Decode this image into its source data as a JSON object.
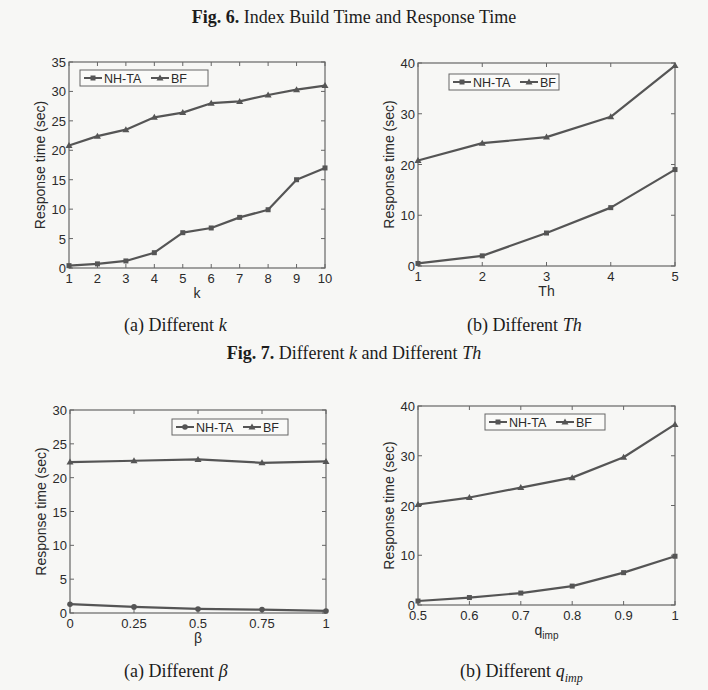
{
  "figures": {
    "fig6": {
      "label": "Fig. 6.",
      "title": "Index Build Time and Response Time"
    },
    "fig7": {
      "label": "Fig. 7.",
      "title_pre": "Different ",
      "title_k": "k",
      "title_mid": " and Different ",
      "title_th": "Th",
      "sub_a": {
        "prefix": "(a) Different ",
        "var": "k"
      },
      "sub_b": {
        "prefix": "(b) Different ",
        "var": "Th"
      }
    },
    "fig8": {
      "sub_a": {
        "prefix": "(a) Different ",
        "var": "β"
      },
      "sub_b": {
        "prefix": "(b) Different ",
        "var": "q",
        "sub": "imp"
      }
    }
  },
  "series_style": {
    "NH-TA": {
      "marker": "square",
      "color": "#555555"
    },
    "BF": {
      "marker": "triangle",
      "color": "#555555"
    }
  },
  "chart_data": [
    {
      "id": "different-k",
      "type": "line",
      "title": "",
      "xlabel": "k",
      "ylabel": "Response time (sec)",
      "x": [
        1,
        2,
        3,
        4,
        5,
        6,
        7,
        8,
        9,
        10
      ],
      "xticks": [
        "1",
        "2",
        "3",
        "4",
        "5",
        "6",
        "7",
        "8",
        "9",
        "10"
      ],
      "ylim": [
        0,
        35
      ],
      "yticks": [
        "0",
        "5",
        "10",
        "15",
        "20",
        "25",
        "30",
        "35"
      ],
      "grid": false,
      "legend_position": "top-left",
      "series": [
        {
          "name": "NH-TA",
          "marker": "square",
          "values": [
            0.4,
            0.7,
            1.2,
            2.6,
            6.0,
            6.8,
            8.6,
            9.9,
            15.0,
            17.0
          ]
        },
        {
          "name": "BF",
          "marker": "triangle",
          "values": [
            20.8,
            22.4,
            23.5,
            25.6,
            26.4,
            28.0,
            28.3,
            29.4,
            30.3,
            31.0
          ]
        }
      ]
    },
    {
      "id": "different-th",
      "type": "line",
      "title": "",
      "xlabel": "Th",
      "ylabel": "Response time (sec)",
      "x": [
        1,
        2,
        3,
        4,
        5
      ],
      "xticks": [
        "1",
        "2",
        "3",
        "4",
        "5"
      ],
      "ylim": [
        0,
        40
      ],
      "yticks": [
        "0",
        "10",
        "20",
        "30",
        "40"
      ],
      "grid": false,
      "legend_position": "top-left",
      "series": [
        {
          "name": "NH-TA",
          "marker": "square",
          "values": [
            0.5,
            2.0,
            6.5,
            11.5,
            19.0
          ]
        },
        {
          "name": "BF",
          "marker": "triangle",
          "values": [
            20.8,
            24.2,
            25.4,
            29.4,
            39.5
          ]
        }
      ]
    },
    {
      "id": "different-beta",
      "type": "line",
      "title": "",
      "xlabel": "β",
      "ylabel": "Response time (sec)",
      "x": [
        0,
        0.25,
        0.5,
        0.75,
        1
      ],
      "xticks": [
        "0",
        "0.25",
        "0.5",
        "0.75",
        "1"
      ],
      "ylim": [
        0,
        30
      ],
      "yticks": [
        "0",
        "5",
        "10",
        "15",
        "20",
        "25",
        "30"
      ],
      "grid": false,
      "legend_position": "top-right",
      "series": [
        {
          "name": "NH-TA",
          "marker": "circle",
          "values": [
            1.3,
            0.9,
            0.6,
            0.5,
            0.3
          ]
        },
        {
          "name": "BF",
          "marker": "triangle",
          "values": [
            22.3,
            22.5,
            22.7,
            22.2,
            22.4
          ]
        }
      ]
    },
    {
      "id": "different-qimp",
      "type": "line",
      "title": "",
      "xlabel": "q_imp",
      "ylabel": "Response time (sec)",
      "x": [
        0.5,
        0.6,
        0.7,
        0.8,
        0.9,
        1.0
      ],
      "xticks": [
        "0.5",
        "0.6",
        "0.7",
        "0.8",
        "0.9",
        "1"
      ],
      "ylim": [
        0,
        40
      ],
      "yticks": [
        "0",
        "10",
        "20",
        "30",
        "40"
      ],
      "grid": false,
      "legend_position": "top-right",
      "series": [
        {
          "name": "NH-TA",
          "marker": "square",
          "values": [
            0.8,
            1.5,
            2.4,
            3.8,
            6.5,
            9.8
          ]
        },
        {
          "name": "BF",
          "marker": "triangle",
          "values": [
            20.2,
            21.6,
            23.6,
            25.6,
            29.7,
            36.3
          ]
        }
      ]
    }
  ]
}
